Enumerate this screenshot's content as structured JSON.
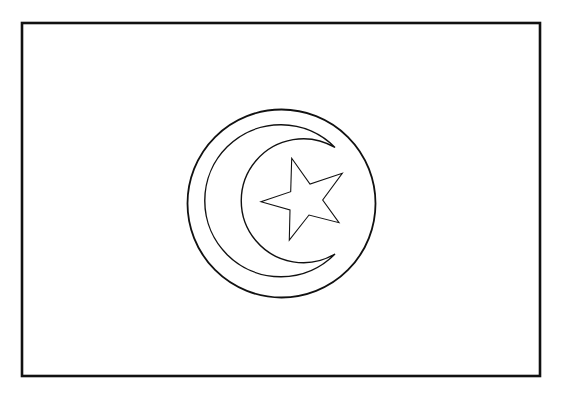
{
  "colors": {
    "background": "#ffffff",
    "stroke": "#111111",
    "fill": "#ffffff"
  },
  "flag": {
    "border": {
      "x": 22,
      "y": 23,
      "width": 518,
      "height": 353,
      "stroke_width": 2.6
    },
    "outer_circle": {
      "cx": 281.5,
      "cy": 203.5,
      "r": 94,
      "stroke_width": 1.8
    },
    "crescent": {
      "outer": {
        "cx": 283,
        "cy": 200,
        "r": 76
      },
      "inner": {
        "cx": 305,
        "cy": 201,
        "r": 62
      },
      "tip_top": [
        335,
        147.5
      ],
      "tip_bottom": [
        335,
        254
      ],
      "stroke_width": 1.4
    },
    "star": {
      "points": [
        [
          291.7,
          158.3
        ],
        [
          310,
          184
        ],
        [
          342.3,
          173.3
        ],
        [
          322.7,
          200
        ],
        [
          339,
          222.7
        ],
        [
          309,
          215
        ],
        [
          289.3,
          240
        ],
        [
          290,
          210
        ],
        [
          261,
          201.7
        ],
        [
          290.7,
          191.7
        ]
      ],
      "stroke_width": 1.1
    }
  }
}
